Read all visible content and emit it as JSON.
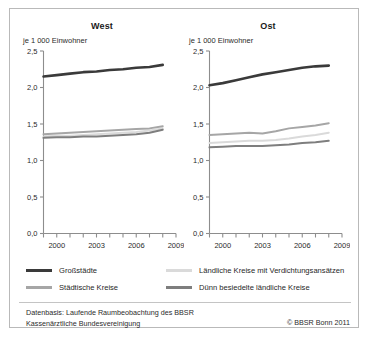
{
  "figure": {
    "unit_label": "je 1 000 Einwohner",
    "panels": [
      {
        "key": "west",
        "title": "West"
      },
      {
        "key": "ost",
        "title": "Ost"
      }
    ]
  },
  "legend": {
    "items": [
      {
        "label": "Großstädte",
        "color": "#3a3a3a",
        "weight": "thick"
      },
      {
        "label": "Ländliche Kreise mit Verdichtungsansätzen",
        "color": "#dadada",
        "weight": "normal"
      },
      {
        "label": "Städtische Kreise",
        "color": "#a6a6a6",
        "weight": "normal"
      },
      {
        "label": "Dünn besiedelte ländliche Kreise",
        "color": "#7e7e7e",
        "weight": "normal"
      }
    ]
  },
  "footer": {
    "line1": "Datenbasis: Laufende Raumbeobachtung des BBSR",
    "line2": "Kassenärztliche Bundesvereinigung",
    "copyright": "© BBSR Bonn 2011"
  },
  "chart_data": {
    "type": "line",
    "title": "",
    "xlabel": "",
    "ylabel": "je 1 000 Einwohner",
    "ylim": [
      0.0,
      2.5
    ],
    "xlim": [
      1999,
      2009
    ],
    "grid": false,
    "legend_position": "bottom",
    "y_ticks": [
      0.0,
      0.5,
      1.0,
      1.5,
      2.0,
      2.5
    ],
    "y_tick_labels": [
      "0,0",
      "0,5",
      "1,0",
      "1,5",
      "2,0",
      "2,5"
    ],
    "x_ticks": [
      1999,
      2000,
      2001,
      2002,
      2003,
      2004,
      2005,
      2006,
      2007,
      2008,
      2009
    ],
    "x_tick_labels": [
      "",
      "2000",
      "",
      "",
      "2003",
      "",
      "",
      "2006",
      "",
      "",
      "2009"
    ],
    "x": [
      1999,
      2000,
      2001,
      2002,
      2003,
      2004,
      2005,
      2006,
      2007,
      2008
    ],
    "panels": [
      {
        "name": "West",
        "series": [
          {
            "name": "Großstädte",
            "color": "#3a3a3a",
            "width": 2.6,
            "values": [
              2.15,
              2.17,
              2.19,
              2.21,
              2.22,
              2.24,
              2.25,
              2.27,
              2.28,
              2.31
            ]
          },
          {
            "name": "Städtische Kreise",
            "color": "#a6a6a6",
            "width": 2.0,
            "values": [
              1.36,
              1.37,
              1.38,
              1.39,
              1.4,
              1.41,
              1.42,
              1.43,
              1.44,
              1.47
            ]
          },
          {
            "name": "Ländliche Kreise mit Verdichtungsansätzen",
            "color": "#dadada",
            "width": 2.0,
            "values": [
              1.33,
              1.34,
              1.34,
              1.35,
              1.36,
              1.37,
              1.38,
              1.39,
              1.41,
              1.44
            ]
          },
          {
            "name": "Dünn besiedelte ländliche Kreise",
            "color": "#7e7e7e",
            "width": 2.0,
            "values": [
              1.31,
              1.32,
              1.32,
              1.33,
              1.33,
              1.34,
              1.35,
              1.36,
              1.38,
              1.42
            ]
          }
        ]
      },
      {
        "name": "Ost",
        "series": [
          {
            "name": "Großstädte",
            "color": "#3a3a3a",
            "width": 2.6,
            "values": [
              2.03,
              2.06,
              2.1,
              2.14,
              2.18,
              2.21,
              2.24,
              2.27,
              2.29,
              2.3
            ]
          },
          {
            "name": "Städtische Kreise",
            "color": "#a6a6a6",
            "width": 2.0,
            "values": [
              1.35,
              1.36,
              1.37,
              1.38,
              1.37,
              1.4,
              1.44,
              1.46,
              1.48,
              1.51
            ]
          },
          {
            "name": "Ländliche Kreise mit Verdichtungsansätzen",
            "color": "#dadada",
            "width": 2.0,
            "values": [
              1.24,
              1.25,
              1.26,
              1.27,
              1.27,
              1.28,
              1.3,
              1.33,
              1.35,
              1.38
            ]
          },
          {
            "name": "Dünn besiedelte ländliche Kreise",
            "color": "#7e7e7e",
            "width": 2.0,
            "values": [
              1.18,
              1.19,
              1.2,
              1.2,
              1.2,
              1.21,
              1.22,
              1.24,
              1.25,
              1.27
            ]
          }
        ]
      }
    ]
  }
}
